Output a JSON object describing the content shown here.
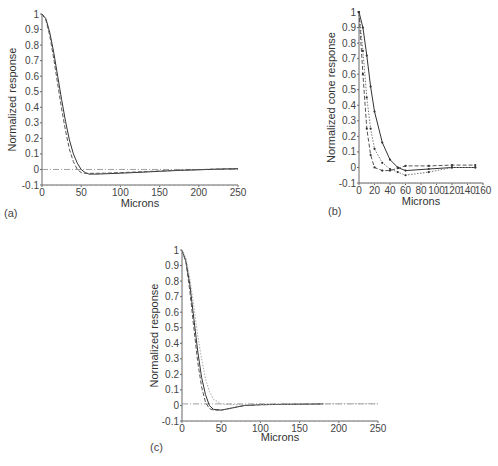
{
  "figure": {
    "panels": [
      "(a)",
      "(b)",
      "(c)"
    ]
  },
  "chart_data": [
    {
      "id": "a",
      "panel_label": "(a)",
      "type": "line",
      "title": "",
      "xlabel": "Microns",
      "ylabel": "Normalized response",
      "xlim": [
        0,
        250
      ],
      "ylim": [
        -0.1,
        1
      ],
      "xticks": [
        0,
        50,
        100,
        150,
        200,
        250
      ],
      "yticks": [
        -0.1,
        0,
        0.1,
        0.2,
        0.3,
        0.4,
        0.5,
        0.6,
        0.7,
        0.8,
        0.9,
        1
      ],
      "ytick_labels": [
        "-0.1",
        "0",
        "0.1",
        "0.2",
        "0.3",
        "0.4",
        "0.5",
        "0.6",
        "0.7",
        "0.8",
        "0.9",
        "1"
      ],
      "grid": false,
      "reference_line": {
        "y": 0,
        "style": "dash-dot"
      },
      "series": [
        {
          "name": "solid",
          "style": "solid",
          "x": [
            0,
            5,
            10,
            15,
            20,
            25,
            30,
            35,
            40,
            45,
            50,
            55,
            60,
            70,
            80,
            100,
            125,
            150,
            175,
            200,
            225,
            250
          ],
          "y": [
            1.0,
            0.97,
            0.88,
            0.75,
            0.6,
            0.45,
            0.31,
            0.19,
            0.1,
            0.04,
            0.0,
            -0.02,
            -0.03,
            -0.03,
            -0.028,
            -0.024,
            -0.018,
            -0.012,
            -0.006,
            -0.002,
            0.002,
            0.005
          ]
        },
        {
          "name": "dashed",
          "style": "dashed",
          "x": [
            0,
            5,
            10,
            15,
            20,
            25,
            30,
            35,
            40,
            45,
            50,
            55,
            60,
            70,
            80,
            100,
            125,
            150,
            175,
            200,
            225,
            250
          ],
          "y": [
            1.0,
            0.96,
            0.86,
            0.71,
            0.55,
            0.39,
            0.25,
            0.13,
            0.05,
            0.0,
            -0.02,
            -0.025,
            -0.025,
            -0.025,
            -0.024,
            -0.02,
            -0.015,
            -0.01,
            -0.005,
            -0.001,
            0.003,
            0.005
          ]
        }
      ]
    },
    {
      "id": "b",
      "panel_label": "(b)",
      "type": "line",
      "title": "",
      "xlabel": "Microns",
      "ylabel": "Normalized cone response",
      "xlim": [
        0,
        160
      ],
      "ylim": [
        -0.1,
        1
      ],
      "xticks": [
        0,
        20,
        40,
        60,
        80,
        100,
        120,
        140,
        160
      ],
      "yticks": [
        -0.1,
        0,
        0.1,
        0.2,
        0.3,
        0.4,
        0.5,
        0.6,
        0.7,
        0.8,
        0.9,
        1
      ],
      "ytick_labels": [
        "-0.1",
        "0",
        "0.1",
        "0.2",
        "0.3",
        "0.4",
        "0.5",
        "0.6",
        "0.7",
        "0.8",
        "0.9",
        "1"
      ],
      "grid": false,
      "series": [
        {
          "name": "solid with markers",
          "style": "solid",
          "x": [
            0,
            5,
            10,
            15,
            20,
            30,
            40,
            50,
            60,
            90,
            120,
            150
          ],
          "y": [
            1.0,
            0.9,
            0.72,
            0.52,
            0.36,
            0.16,
            0.05,
            0.0,
            -0.02,
            -0.01,
            0.0,
            0.0
          ]
        },
        {
          "name": "dotted with markers",
          "style": "dotted",
          "x": [
            0,
            5,
            10,
            15,
            20,
            30,
            40,
            50,
            60,
            90,
            120,
            150
          ],
          "y": [
            1.0,
            0.75,
            0.45,
            0.25,
            0.12,
            0.03,
            -0.01,
            -0.03,
            -0.05,
            -0.03,
            0.0,
            0.0
          ]
        },
        {
          "name": "dashed with markers",
          "style": "dashed",
          "x": [
            0,
            5,
            10,
            15,
            20,
            30,
            40,
            50,
            60,
            90,
            120,
            150
          ],
          "y": [
            1.0,
            0.6,
            0.25,
            0.08,
            0.0,
            -0.02,
            -0.02,
            -0.005,
            0.01,
            0.01,
            0.015,
            0.015
          ]
        }
      ]
    },
    {
      "id": "c",
      "panel_label": "(c)",
      "type": "line",
      "title": "",
      "xlabel": "Microns",
      "ylabel": "Normalized response",
      "xlim": [
        0,
        250
      ],
      "ylim": [
        -0.1,
        1
      ],
      "xticks": [
        0,
        50,
        100,
        150,
        200,
        250
      ],
      "yticks": [
        -0.1,
        0,
        0.1,
        0.2,
        0.3,
        0.4,
        0.5,
        0.6,
        0.7,
        0.8,
        0.9,
        1
      ],
      "ytick_labels": [
        "-0.1",
        "0",
        "0.1",
        "0.2",
        "0.3",
        "0.4",
        "0.5",
        "0.6",
        "0.7",
        "0.8",
        "0.9",
        "1"
      ],
      "grid": false,
      "reference_line": {
        "y": 0.01,
        "style": "dash-dot"
      },
      "series": [
        {
          "name": "solid",
          "style": "solid",
          "x": [
            0,
            5,
            10,
            15,
            20,
            25,
            30,
            35,
            40,
            50,
            60,
            70,
            80,
            100,
            125,
            150,
            180
          ],
          "y": [
            1.0,
            0.93,
            0.78,
            0.56,
            0.35,
            0.18,
            0.07,
            0.0,
            -0.025,
            -0.03,
            -0.02,
            -0.01,
            0.0,
            0.005,
            0.007,
            0.008,
            0.01
          ]
        },
        {
          "name": "dashed",
          "style": "dashed",
          "x": [
            0,
            5,
            10,
            15,
            20,
            25,
            30,
            35,
            40,
            50,
            60,
            70,
            80,
            100,
            125,
            150,
            180
          ],
          "y": [
            1.0,
            0.92,
            0.74,
            0.5,
            0.28,
            0.12,
            0.02,
            -0.02,
            -0.03,
            -0.03,
            -0.02,
            -0.01,
            0.0,
            0.005,
            0.007,
            0.008,
            0.01
          ]
        },
        {
          "name": "dotted (light)",
          "style": "dotted",
          "x": [
            0,
            5,
            10,
            15,
            20,
            25,
            30,
            35,
            40,
            50,
            60,
            80,
            100,
            150,
            250
          ],
          "y": [
            1.0,
            0.95,
            0.82,
            0.64,
            0.45,
            0.3,
            0.17,
            0.09,
            0.04,
            0.01,
            0.005,
            0.005,
            0.008,
            0.01,
            0.012
          ]
        }
      ]
    }
  ]
}
